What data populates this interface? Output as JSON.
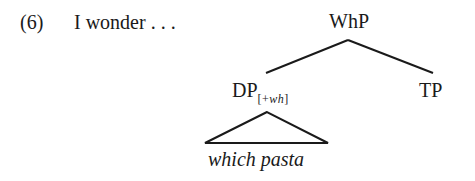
{
  "example": {
    "number": "(6)",
    "lead_text": "I wonder . . ."
  },
  "tree": {
    "root": {
      "label": "WhP"
    },
    "left_child": {
      "label": "DP",
      "feature_open": "[+",
      "feature": "wh",
      "feature_close": "]"
    },
    "right_child": {
      "label": "TP"
    },
    "leaf": {
      "text": "which pasta",
      "style": "italic",
      "under_triangle": true
    }
  },
  "colors": {
    "ink": "#1a1a1a",
    "background": "#ffffff"
  }
}
